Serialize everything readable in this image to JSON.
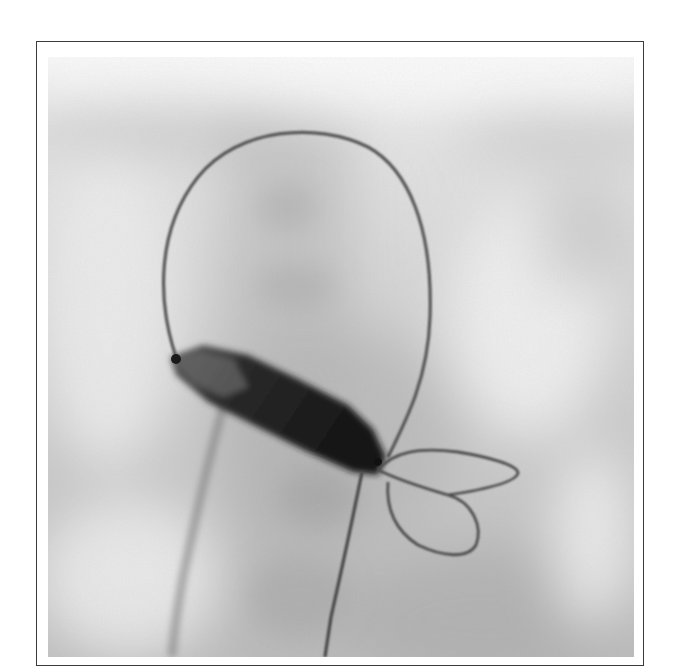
{
  "figure": {
    "type": "fluoroscopy",
    "colors": {
      "background_light": "#f4f4f4",
      "background_mid": "#c8c8c8",
      "background_dark": "#a9a9a9",
      "wire": "#5a5a5a",
      "balloon_dark": "#1e1e1e",
      "balloon_mid": "#4a4a4a",
      "frame_border": "#3a3a3a"
    },
    "elements": [
      {
        "name": "guidewire-loop",
        "description": "large looping guidewire over top"
      },
      {
        "name": "balloon",
        "description": "dark inflated balloon, diagonal"
      },
      {
        "name": "pigtail-loops",
        "description": "two small wire loops at balloon distal end"
      },
      {
        "name": "catheter-shaft-left",
        "description": "faint shaft descending to lower left"
      },
      {
        "name": "guidewire-shaft-right",
        "description": "wire descending from balloon to bottom"
      }
    ]
  }
}
